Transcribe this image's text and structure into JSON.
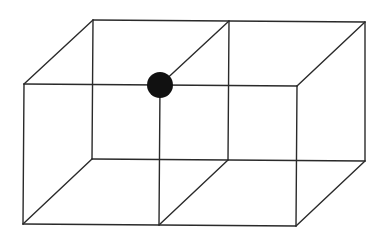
{
  "diagram": {
    "colors": {
      "background": "#ffffff",
      "edge": "#2a2a2a",
      "dot": "#111111"
    },
    "vertices": {
      "front_top_left": [
        24,
        84
      ],
      "front_top_mid": [
        160,
        85
      ],
      "front_top_right": [
        297,
        86
      ],
      "front_bottom_left": [
        23,
        224
      ],
      "front_bottom_mid": [
        159,
        225
      ],
      "front_bottom_right": [
        296,
        226
      ],
      "back_top_left": [
        93,
        20
      ],
      "back_top_mid": [
        229,
        21
      ],
      "back_top_right": [
        365,
        22
      ],
      "back_bottom_left": [
        92,
        159
      ],
      "back_bottom_mid": [
        228,
        160
      ],
      "back_bottom_right": [
        365,
        161
      ]
    },
    "edges": [
      [
        "front_top_left",
        "front_top_right"
      ],
      [
        "front_bottom_left",
        "front_bottom_right"
      ],
      [
        "front_top_left",
        "front_bottom_left"
      ],
      [
        "front_top_mid",
        "front_bottom_mid"
      ],
      [
        "front_top_right",
        "front_bottom_right"
      ],
      [
        "back_top_left",
        "back_top_right"
      ],
      [
        "back_bottom_left",
        "back_bottom_right"
      ],
      [
        "back_top_left",
        "back_bottom_left"
      ],
      [
        "back_top_mid",
        "back_bottom_mid"
      ],
      [
        "back_top_right",
        "back_bottom_right"
      ],
      [
        "front_top_left",
        "back_top_left"
      ],
      [
        "front_top_mid",
        "back_top_mid"
      ],
      [
        "front_top_right",
        "back_top_right"
      ],
      [
        "front_bottom_left",
        "back_bottom_left"
      ],
      [
        "front_bottom_mid",
        "back_bottom_mid"
      ],
      [
        "front_bottom_right",
        "back_bottom_right"
      ]
    ],
    "highlight": {
      "vertex": "front_top_mid",
      "radius": 13
    }
  }
}
